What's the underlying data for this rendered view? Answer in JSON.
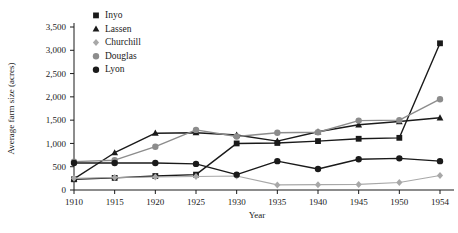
{
  "chart_data": {
    "type": "line",
    "title": "",
    "xlabel": "Year",
    "ylabel": "Average farm size (acres)",
    "categories": [
      "1910",
      "1915",
      "1920",
      "1925",
      "1930",
      "1935",
      "1940",
      "1945",
      "1950",
      "1954"
    ],
    "x": [
      1910,
      1915,
      1920,
      1925,
      1930,
      1935,
      1940,
      1945,
      1950,
      1954
    ],
    "xlim": [
      1910,
      1954
    ],
    "ylim": [
      0,
      3500
    ],
    "ytick_labels": [
      "0",
      "500",
      "1,000",
      "1,500",
      "2,000",
      "2,500",
      "3,000",
      "3,500"
    ],
    "yticks": [
      0,
      500,
      1000,
      1500,
      2000,
      2500,
      3000,
      3500
    ],
    "grid": false,
    "legend_position": "top-left",
    "series": [
      {
        "name": "Inyo",
        "marker": "square",
        "color": "#1a1a1a",
        "values": [
          230,
          260,
          300,
          330,
          1000,
          1010,
          1050,
          1100,
          1120,
          3150
        ]
      },
      {
        "name": "Lassen",
        "marker": "triangle",
        "color": "#1a1a1a",
        "values": [
          240,
          800,
          1220,
          1230,
          1180,
          1050,
          1250,
          1400,
          1470,
          1550
        ]
      },
      {
        "name": "Churchill",
        "marker": "diamond",
        "color": "#a8a8a8",
        "values": [
          250,
          270,
          280,
          290,
          300,
          110,
          115,
          120,
          160,
          310
        ]
      },
      {
        "name": "Douglas",
        "marker": "circle-gray",
        "color": "#8c8c8c",
        "values": [
          610,
          640,
          930,
          1290,
          1150,
          1230,
          1240,
          1490,
          1500,
          1950
        ]
      },
      {
        "name": "Lyon",
        "marker": "circle",
        "color": "#1a1a1a",
        "values": [
          580,
          580,
          580,
          560,
          330,
          620,
          450,
          660,
          680,
          620
        ]
      }
    ]
  }
}
